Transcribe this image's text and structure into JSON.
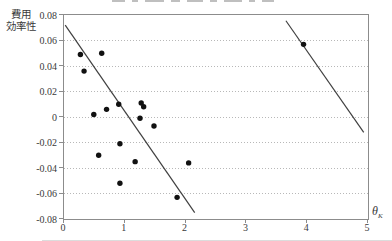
{
  "figure": {
    "y_axis_title_line1": "費用",
    "y_axis_title_line2": "効率性",
    "x_axis_symbol": "θ",
    "x_axis_subscript": "K"
  },
  "chart_data": {
    "type": "scatter",
    "xlabel": "θK",
    "ylabel": "費用/効率性",
    "xlim": [
      0,
      5
    ],
    "ylim": [
      -0.08,
      0.08
    ],
    "grid": "horizontal dotted lines every 0.02",
    "legend_position": "none",
    "x_ticks": [
      {
        "label": "0",
        "value": 0
      },
      {
        "label": "1",
        "value": 1
      },
      {
        "label": "2",
        "value": 2
      },
      {
        "label": "3",
        "value": 3
      },
      {
        "label": "4",
        "value": 4
      },
      {
        "label": "5",
        "value": 5
      }
    ],
    "y_ticks": [
      {
        "label": "0.08",
        "value": 0.08
      },
      {
        "label": "0.06",
        "value": 0.06
      },
      {
        "label": "0.04",
        "value": 0.04
      },
      {
        "label": "0.02",
        "value": 0.02
      },
      {
        "label": "0",
        "value": 0
      },
      {
        "label": "-0.02",
        "value": -0.02
      },
      {
        "label": "-0.04",
        "value": -0.04
      },
      {
        "label": "-0.06",
        "value": -0.06
      },
      {
        "label": "-0.08",
        "value": -0.08
      }
    ],
    "gridline_values": [
      0.06,
      0.04,
      0.02,
      0,
      -0.02,
      -0.04,
      -0.06
    ],
    "points": [
      {
        "x": 0.27,
        "y": 0.049
      },
      {
        "x": 0.62,
        "y": 0.05
      },
      {
        "x": 0.33,
        "y": 0.036
      },
      {
        "x": 0.49,
        "y": 0.002
      },
      {
        "x": 0.7,
        "y": 0.006
      },
      {
        "x": 0.9,
        "y": 0.01
      },
      {
        "x": 1.27,
        "y": 0.011
      },
      {
        "x": 1.31,
        "y": 0.008
      },
      {
        "x": 1.25,
        "y": -0.001
      },
      {
        "x": 1.48,
        "y": -0.007
      },
      {
        "x": 0.92,
        "y": -0.021
      },
      {
        "x": 0.57,
        "y": -0.03
      },
      {
        "x": 1.17,
        "y": -0.035
      },
      {
        "x": 2.05,
        "y": -0.036
      },
      {
        "x": 0.92,
        "y": -0.052
      },
      {
        "x": 1.86,
        "y": -0.063
      },
      {
        "x": 3.94,
        "y": 0.057
      }
    ],
    "trend_lines": [
      {
        "x1": 0.02,
        "y1": 0.072,
        "x2": 2.15,
        "y2": -0.075
      },
      {
        "x1": 3.65,
        "y1": 0.0755,
        "x2": 4.93,
        "y2": -0.012
      }
    ],
    "colors": {
      "point": "#111111",
      "trend_line": "#404040",
      "gridline": "#b8b8b8",
      "axis_border": "#8c8c8c",
      "text": "#3a3a3a"
    }
  }
}
